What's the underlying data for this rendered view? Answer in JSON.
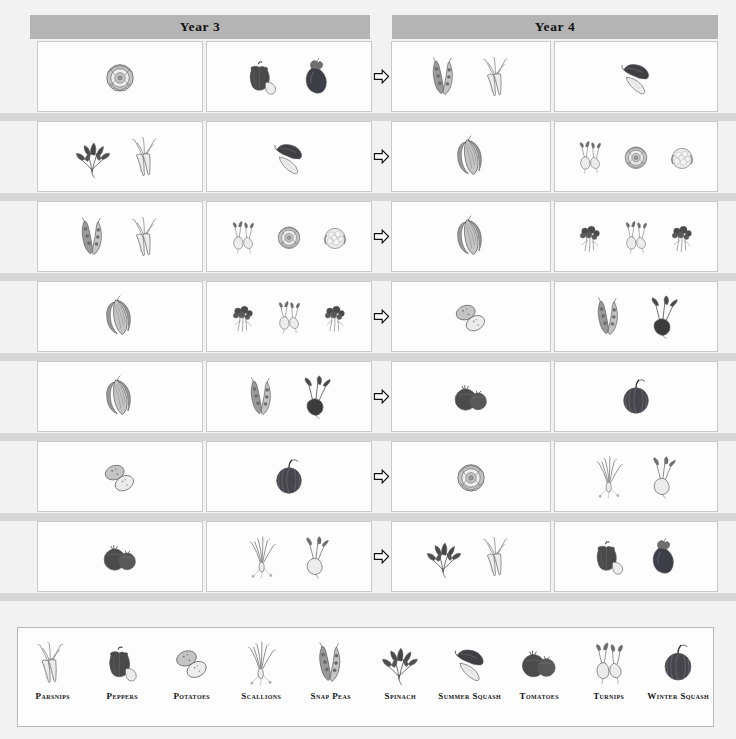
{
  "headers": {
    "year3": "Year 3",
    "year4": "Year 4"
  },
  "arrow": {
    "glyph_name": "arrow-right-icon",
    "label": "rotates to"
  },
  "colors": {
    "page_background": "#f2f2f2",
    "header_band": "#b4b4b4",
    "row_separator": "#d6d6d6",
    "cell_background": "#fdfdfd",
    "cell_border": "#c9c9c9",
    "text": "#141414"
  },
  "rotation_rows": [
    {
      "index": 1,
      "year3_bed_a": [
        "lettuce"
      ],
      "year3_bed_b": [
        "peppers",
        "eggplant"
      ],
      "year4_bed_a": [
        "snap-peas",
        "parsnips"
      ],
      "year4_bed_b": [
        "summer-squash"
      ]
    },
    {
      "index": 2,
      "year3_bed_a": [
        "spinach",
        "parsnips"
      ],
      "year3_bed_b": [
        "summer-squash"
      ],
      "year4_bed_a": [
        "corn"
      ],
      "year4_bed_b": [
        "turnips",
        "lettuce",
        "cauliflower"
      ]
    },
    {
      "index": 3,
      "year3_bed_a": [
        "snap-peas",
        "parsnips"
      ],
      "year3_bed_b": [
        "turnips",
        "lettuce",
        "cauliflower"
      ],
      "year4_bed_a": [
        "corn"
      ],
      "year4_bed_b": [
        "broccoli",
        "turnips",
        "broccoli"
      ]
    },
    {
      "index": 4,
      "year3_bed_a": [
        "corn"
      ],
      "year3_bed_b": [
        "broccoli",
        "turnips",
        "broccoli"
      ],
      "year4_bed_a": [
        "potatoes"
      ],
      "year4_bed_b": [
        "snap-peas",
        "beets"
      ]
    },
    {
      "index": 5,
      "year3_bed_a": [
        "corn"
      ],
      "year3_bed_b": [
        "snap-peas",
        "beets"
      ],
      "year4_bed_a": [
        "tomatoes"
      ],
      "year4_bed_b": [
        "winter-squash"
      ]
    },
    {
      "index": 6,
      "year3_bed_a": [
        "potatoes"
      ],
      "year3_bed_b": [
        "winter-squash"
      ],
      "year4_bed_a": [
        "lettuce"
      ],
      "year4_bed_b": [
        "scallions",
        "turnips"
      ]
    },
    {
      "index": 7,
      "year3_bed_a": [
        "tomatoes"
      ],
      "year3_bed_b": [
        "scallions",
        "turnips"
      ],
      "year4_bed_a": [
        "spinach",
        "parsnips"
      ],
      "year4_bed_b": [
        "peppers",
        "eggplant"
      ]
    }
  ],
  "legend": [
    {
      "icon": "parsnips",
      "label": "Parsnips"
    },
    {
      "icon": "peppers",
      "label": "Peppers"
    },
    {
      "icon": "potatoes",
      "label": "Potatoes"
    },
    {
      "icon": "scallions",
      "label": "Scallions"
    },
    {
      "icon": "snap-peas",
      "label": "Snap Peas"
    },
    {
      "icon": "spinach",
      "label": "Spinach"
    },
    {
      "icon": "summer-squash",
      "label": "Summer Squash"
    },
    {
      "icon": "tomatoes",
      "label": "Tomatoes"
    },
    {
      "icon": "turnips",
      "label": "Turnips"
    },
    {
      "icon": "winter-squash",
      "label": "Winter Squash"
    }
  ]
}
